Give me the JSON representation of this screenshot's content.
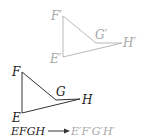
{
  "colors": {
    "image_stroke": "#b8b8b8",
    "image_label": "#a8a8a8",
    "original_stroke": "#333333",
    "original_label": "#222222"
  },
  "image_shape": {
    "labels": {
      "F": "F′",
      "G": "G′",
      "H": "H′",
      "E": "E′"
    }
  },
  "original_shape": {
    "labels": {
      "F": "F",
      "G": "G",
      "H": "H",
      "E": "E"
    }
  },
  "caption": {
    "from": "EFGH",
    "arrow": "→",
    "to": "E′F′G′H′"
  }
}
